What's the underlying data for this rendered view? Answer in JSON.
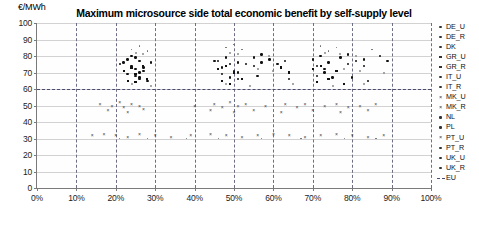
{
  "chart_data": {
    "type": "scatter",
    "title": "Maximum microsource side total economic benefit  by self-supply level",
    "xlabel": "",
    "ylabel": "€/MWh",
    "yunit_label": "€/MWh",
    "xlim": [
      0,
      100
    ],
    "ylim": [
      0,
      100
    ],
    "ytick_labels": [
      "100",
      "90",
      "80",
      "70",
      "60",
      "50",
      "40",
      "30",
      "20",
      "10",
      "0"
    ],
    "ytick_values": [
      100,
      90,
      80,
      70,
      60,
      50,
      40,
      30,
      20,
      10,
      0
    ],
    "xtick_labels": [
      "0%",
      "10%",
      "20%",
      "30%",
      "40%",
      "50%",
      "60%",
      "70%",
      "80%",
      "90%",
      "100%"
    ],
    "xtick_values": [
      0,
      10,
      20,
      30,
      40,
      50,
      60,
      70,
      80,
      90,
      100
    ],
    "grid": "horizontal solid, vertical dashed at every 10%",
    "legend_position": "right",
    "reference_lines": [
      {
        "name": "EU",
        "orientation": "horizontal",
        "value": 60,
        "style": "dashed"
      }
    ],
    "series": [
      {
        "name": "DE_U",
        "marker": "dot",
        "points": [
          [
            22,
            76
          ],
          [
            23,
            78
          ],
          [
            24,
            74
          ],
          [
            24,
            80
          ],
          [
            25,
            72
          ],
          [
            26,
            77
          ],
          [
            26,
            70
          ],
          [
            27,
            73
          ],
          [
            46,
            77
          ],
          [
            47,
            73
          ],
          [
            48,
            79
          ],
          [
            49,
            75
          ],
          [
            50,
            71
          ],
          [
            51,
            76
          ],
          [
            70,
            78
          ],
          [
            71,
            74
          ],
          [
            72,
            80
          ],
          [
            73,
            72
          ],
          [
            74,
            76
          ]
        ]
      },
      {
        "name": "DE_R",
        "marker": "dot",
        "points": [
          [
            23,
            69
          ],
          [
            25,
            68
          ],
          [
            26,
            66
          ],
          [
            27,
            71
          ],
          [
            47,
            69
          ],
          [
            49,
            67
          ],
          [
            51,
            70
          ],
          [
            71,
            68
          ],
          [
            73,
            70
          ],
          [
            75,
            67
          ]
        ]
      },
      {
        "name": "DK",
        "marker": "tiny",
        "points": [
          [
            24,
            84
          ],
          [
            26,
            86
          ],
          [
            28,
            83
          ],
          [
            48,
            85
          ],
          [
            50,
            87
          ],
          [
            52,
            84
          ],
          [
            72,
            86
          ],
          [
            74,
            83
          ],
          [
            76,
            85
          ],
          [
            85,
            84
          ]
        ]
      },
      {
        "name": "GR_U",
        "marker": "square",
        "points": [
          [
            22,
            71
          ],
          [
            24,
            73
          ],
          [
            25,
            69
          ],
          [
            27,
            74
          ],
          [
            46,
            72
          ],
          [
            48,
            74
          ],
          [
            50,
            70
          ],
          [
            62,
            73
          ],
          [
            64,
            70
          ],
          [
            70,
            72
          ],
          [
            72,
            74
          ],
          [
            76,
            71
          ]
        ]
      },
      {
        "name": "GR_R",
        "marker": "square",
        "points": [
          [
            23,
            65
          ],
          [
            25,
            64
          ],
          [
            28,
            66
          ],
          [
            47,
            65
          ],
          [
            49,
            63
          ],
          [
            52,
            66
          ],
          [
            71,
            64
          ],
          [
            74,
            66
          ],
          [
            78,
            63
          ]
        ]
      },
      {
        "name": "IT_U",
        "marker": "dot",
        "points": [
          [
            21,
            75
          ],
          [
            25,
            79
          ],
          [
            29,
            76
          ],
          [
            45,
            77
          ],
          [
            53,
            75
          ],
          [
            55,
            74
          ],
          [
            57,
            76
          ],
          [
            61,
            75
          ],
          [
            63,
            77
          ],
          [
            79,
            75
          ],
          [
            81,
            77
          ],
          [
            83,
            74
          ]
        ]
      },
      {
        "name": "IT_R",
        "marker": "dot",
        "points": [
          [
            26,
            67
          ],
          [
            28,
            65
          ],
          [
            51,
            66
          ],
          [
            56,
            68
          ],
          [
            64,
            66
          ],
          [
            80,
            67
          ],
          [
            84,
            65
          ]
        ]
      },
      {
        "name": "MK_U",
        "marker": "cross",
        "points": [
          [
            16,
            51
          ],
          [
            19,
            50
          ],
          [
            21,
            52
          ],
          [
            22,
            49
          ],
          [
            24,
            51
          ],
          [
            26,
            50
          ],
          [
            40,
            50
          ],
          [
            45,
            51
          ],
          [
            47,
            49
          ],
          [
            49,
            52
          ],
          [
            51,
            50
          ],
          [
            53,
            51
          ],
          [
            58,
            50
          ],
          [
            63,
            51
          ],
          [
            66,
            49
          ],
          [
            68,
            51
          ],
          [
            73,
            50
          ],
          [
            76,
            51
          ],
          [
            79,
            49
          ],
          [
            82,
            50
          ],
          [
            86,
            51
          ]
        ]
      },
      {
        "name": "MK_R",
        "marker": "cross",
        "points": [
          [
            18,
            47
          ],
          [
            23,
            46
          ],
          [
            27,
            48
          ],
          [
            44,
            47
          ],
          [
            50,
            46
          ],
          [
            55,
            47
          ],
          [
            62,
            46
          ],
          [
            70,
            47
          ],
          [
            77,
            46
          ],
          [
            84,
            47
          ]
        ]
      },
      {
        "name": "NL",
        "marker": "light",
        "points": [
          [
            25,
            82
          ],
          [
            27,
            81
          ],
          [
            49,
            82
          ],
          [
            51,
            81
          ],
          [
            59,
            80
          ],
          [
            73,
            82
          ],
          [
            77,
            81
          ],
          [
            81,
            80
          ]
        ]
      },
      {
        "name": "PL",
        "marker": "light",
        "points": [
          [
            24,
            63
          ],
          [
            29,
            62
          ],
          [
            48,
            63
          ],
          [
            54,
            62
          ],
          [
            65,
            63
          ],
          [
            75,
            62
          ],
          [
            83,
            63
          ]
        ]
      },
      {
        "name": "PT_U",
        "marker": "cross",
        "points": [
          [
            14,
            32
          ],
          [
            17,
            33
          ],
          [
            20,
            32
          ],
          [
            23,
            31
          ],
          [
            26,
            33
          ],
          [
            30,
            32
          ],
          [
            34,
            31
          ],
          [
            39,
            32
          ],
          [
            44,
            33
          ],
          [
            48,
            32
          ],
          [
            52,
            31
          ],
          [
            56,
            32
          ],
          [
            60,
            33
          ],
          [
            64,
            32
          ],
          [
            68,
            31
          ],
          [
            72,
            32
          ],
          [
            76,
            33
          ],
          [
            80,
            32
          ],
          [
            84,
            31
          ],
          [
            88,
            32
          ]
        ]
      },
      {
        "name": "PT_R",
        "marker": "tiny",
        "points": [
          [
            21,
            30
          ],
          [
            28,
            30
          ],
          [
            38,
            30
          ],
          [
            46,
            30
          ],
          [
            57,
            30
          ],
          [
            67,
            30
          ],
          [
            78,
            30
          ],
          [
            86,
            30
          ]
        ]
      },
      {
        "name": "UK_U",
        "marker": "dot",
        "points": [
          [
            55,
            79
          ],
          [
            57,
            81
          ],
          [
            59,
            78
          ],
          [
            77,
            79
          ],
          [
            79,
            81
          ],
          [
            83,
            78
          ],
          [
            87,
            80
          ],
          [
            89,
            77
          ]
        ]
      },
      {
        "name": "UK_R",
        "marker": "light",
        "points": [
          [
            56,
            72
          ],
          [
            60,
            71
          ],
          [
            78,
            72
          ],
          [
            82,
            71
          ],
          [
            88,
            70
          ]
        ]
      }
    ]
  },
  "legend": {
    "items": [
      {
        "label": "DE_U",
        "marker": "dot"
      },
      {
        "label": "DE_R",
        "marker": "dot"
      },
      {
        "label": "DK",
        "marker": "tiny"
      },
      {
        "label": "GR_U",
        "marker": "square"
      },
      {
        "label": "GR_R",
        "marker": "square"
      },
      {
        "label": "IT_U",
        "marker": "dot"
      },
      {
        "label": "IT_R",
        "marker": "dot"
      },
      {
        "label": "MK_U",
        "marker": "cross"
      },
      {
        "label": "MK_R",
        "marker": "cross"
      },
      {
        "label": "NL",
        "marker": "light"
      },
      {
        "label": "PL",
        "marker": "light"
      },
      {
        "label": "PT_U",
        "marker": "cross"
      },
      {
        "label": "PT_R",
        "marker": "tiny"
      },
      {
        "label": "UK_U",
        "marker": "dot"
      },
      {
        "label": "UK_R",
        "marker": "light"
      },
      {
        "label": "EU",
        "marker": "dashed-line"
      }
    ]
  },
  "colors": {
    "gridline": "#d2d2d2",
    "vertical_gridline": "#6d6d84",
    "axis": "#7a7a7a",
    "marker": "#111111",
    "eu_line": "#4a4a6e",
    "background": "#ffffff"
  }
}
